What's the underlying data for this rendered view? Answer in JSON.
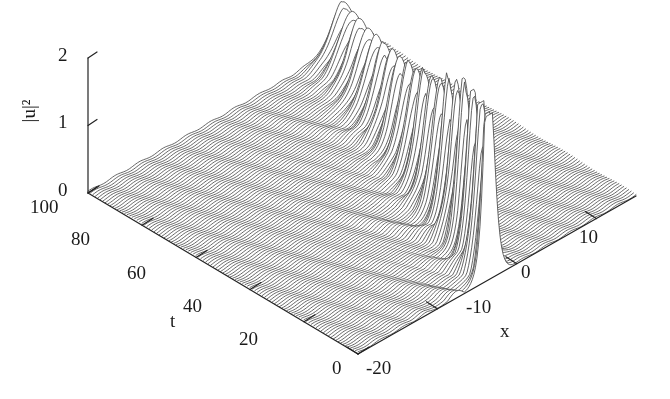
{
  "figure": {
    "type": "3d-surface-mesh",
    "background_color": "#ffffff",
    "mesh_color": "#4a4a4a",
    "axis_color": "#222222"
  },
  "axes": {
    "z": {
      "label": "|u|²",
      "ticks": [
        "2",
        "1",
        "0"
      ],
      "tick_values": [
        2,
        1,
        0
      ],
      "range": [
        0,
        2
      ]
    },
    "t": {
      "label": "t",
      "ticks": [
        "100",
        "80",
        "60",
        "40",
        "20",
        "0"
      ],
      "tick_values": [
        100,
        80,
        60,
        40,
        20,
        0
      ],
      "range": [
        0,
        100
      ]
    },
    "x": {
      "label": "x",
      "ticks": [
        "-20",
        "-10",
        "0",
        "10"
      ],
      "tick_values": [
        -20,
        -10,
        0,
        10
      ],
      "range": [
        -20,
        15
      ]
    }
  },
  "chart_data": {
    "type": "surface",
    "title": "",
    "xlabel": "x",
    "ylabel": "t",
    "zlabel": "|u|²",
    "xlim": [
      -20,
      15
    ],
    "ylim": [
      0,
      100
    ],
    "zlim": [
      0,
      2
    ],
    "grid": false,
    "legend": "none",
    "surface": {
      "nx": 180,
      "nt": 110,
      "background_level": 0.02,
      "peak_value": 2.35,
      "peak_at": {
        "x": -3.5,
        "t": 8
      },
      "pulse_train": {
        "count": 18,
        "x_center_start": -3.5,
        "x_center_end": 11.5,
        "spacing_t": 5.4,
        "width": 0.9,
        "envelope_decay": 0.72,
        "ripple_amplitude": 0.35
      }
    },
    "t_tick_values": [
      0,
      20,
      40,
      60,
      80,
      100
    ],
    "x_tick_values": [
      -20,
      -10,
      0,
      10
    ],
    "z_tick_values": [
      0,
      1,
      2
    ]
  },
  "tick_positions": {
    "z": [
      {
        "label": "2",
        "left": 58,
        "top": 44
      },
      {
        "label": "1",
        "left": 58,
        "top": 111
      },
      {
        "label": "0",
        "left": 58,
        "top": 179
      }
    ],
    "t": [
      {
        "label": "100",
        "left": 30,
        "top": 196
      },
      {
        "label": "80",
        "left": 71,
        "top": 228
      },
      {
        "label": "60",
        "left": 127,
        "top": 262
      },
      {
        "label": "20",
        "left": 239,
        "top": 328
      },
      {
        "label": "40",
        "left": 183,
        "top": 295
      },
      {
        "label": "0",
        "left": 332,
        "top": 357
      }
    ],
    "x": [
      {
        "label": "-20",
        "left": 366,
        "top": 357
      },
      {
        "label": "-10",
        "left": 466,
        "top": 296
      },
      {
        "label": "0",
        "left": 521,
        "top": 261
      },
      {
        "label": "10",
        "left": 579,
        "top": 226
      }
    ],
    "axis_titles": [
      {
        "name": "t",
        "label": "t",
        "left": 170,
        "top": 310
      },
      {
        "name": "x",
        "label": "x",
        "left": 500,
        "top": 320
      },
      {
        "name": "z",
        "label": "|u|²",
        "left": 20,
        "top": 100
      }
    ]
  }
}
